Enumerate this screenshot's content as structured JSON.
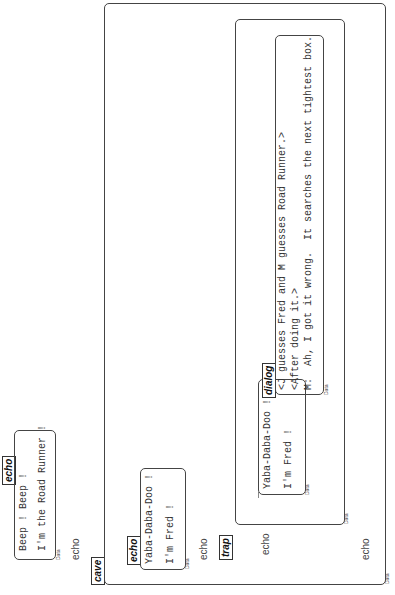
{
  "diagram": {
    "orientation": "rotated-90-ccw",
    "top_echo": {
      "tab_label": "echo",
      "lines": [
        "Beep ! Beep !",
        "I'm the Road Runner !"
      ],
      "data_label": "Data",
      "after_text": "echo"
    },
    "cave": {
      "tab_label": "cave",
      "echo_block": {
        "tab_label": "echo",
        "lines": [
          "Yaba-Daba-Doo !",
          "I'm Fred !"
        ],
        "data_label": "Data"
      },
      "after_echo_text": "echo",
      "trap": {
        "tab_label": "trap",
        "echo_text": "echo",
        "fred_box": {
          "lines": [
            "Yaba-Daba-Doo !",
            "I'm Fred !"
          ],
          "data_label": "Data"
        },
        "dialog": {
          "tab_label": "dialog",
          "lines": [
            "<J guesses Fred and M guesses Road Runner.>",
            "<After doing it.>",
            "M:  Ah, I got it wrong.  It searches the next tightest box."
          ],
          "data_label": "Data"
        },
        "data_label": "Data"
      },
      "end_echo_text": "echo",
      "data_label": "Data"
    }
  }
}
